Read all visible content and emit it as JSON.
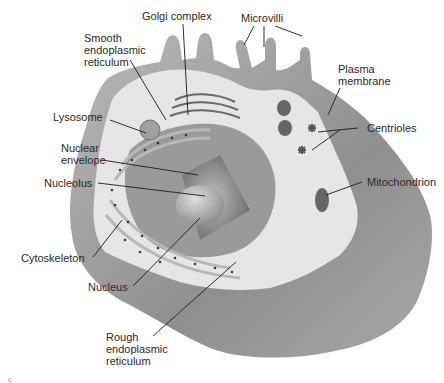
{
  "figure": {
    "corner_mark": "c"
  },
  "labels": [
    {
      "id": "golgi",
      "text": "Golgi complex",
      "x": 142,
      "y": 10
    },
    {
      "id": "microvilli",
      "text": "Microvilli",
      "x": 241,
      "y": 12
    },
    {
      "id": "smooth_er",
      "text": "Smooth\nendoplasmic\nreticulum",
      "x": 84,
      "y": 32
    },
    {
      "id": "plasma_membrane",
      "text": "Plasma\nmembrane",
      "x": 338,
      "y": 63
    },
    {
      "id": "lysosome",
      "text": "Lysosome",
      "x": 53,
      "y": 111
    },
    {
      "id": "centrioles",
      "text": "Centrioles",
      "x": 367,
      "y": 122
    },
    {
      "id": "nuclear_envelope",
      "text": "Nuclear\nenvelope",
      "x": 61,
      "y": 142
    },
    {
      "id": "nucleolus",
      "text": "Nucleolus",
      "x": 44,
      "y": 177
    },
    {
      "id": "mitochondrion",
      "text": "Mitochondrion",
      "x": 367,
      "y": 176
    },
    {
      "id": "cytoskeleton",
      "text": "Cytoskeleton",
      "x": 21,
      "y": 252
    },
    {
      "id": "nucleus",
      "text": "Nucleus",
      "x": 88,
      "y": 281
    },
    {
      "id": "rough_er",
      "text": "Rough\nendoplasmic\nreticulum",
      "x": 106,
      "y": 331
    }
  ],
  "colors": {
    "outer_shell": "#9a9a9a",
    "cut_face": "#e8e8e8",
    "nucleus": "#8c8c8c",
    "line": "#1a1a1a",
    "text": "#2a2a2a"
  }
}
